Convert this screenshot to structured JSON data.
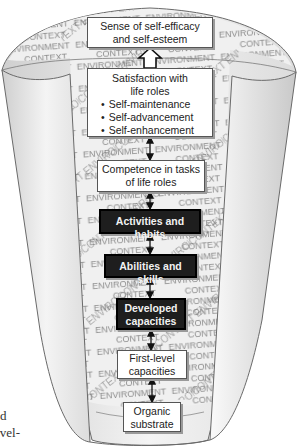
{
  "diagram": {
    "type": "funnel-hierarchy",
    "background_words": [
      "ENVIRONMENT",
      "CONTEXT"
    ],
    "levels": [
      {
        "id": "self-efficacy",
        "lines": [
          "Sense of self-efficacy",
          "and self-esteem"
        ],
        "style": "light"
      },
      {
        "id": "satisfaction",
        "lines": [
          "Satisfaction with",
          "life roles"
        ],
        "bullets": [
          "Self-maintenance",
          "Self-advancement",
          "Self-enhancement"
        ],
        "style": "light"
      },
      {
        "id": "competence",
        "lines": [
          "Competence in tasks",
          "of life roles"
        ],
        "style": "light"
      },
      {
        "id": "activities",
        "lines": [
          "Activities and habits"
        ],
        "style": "dark"
      },
      {
        "id": "abilities",
        "lines": [
          "Abilities and skills"
        ],
        "style": "dark"
      },
      {
        "id": "developed",
        "lines": [
          "Developed",
          "capacities"
        ],
        "style": "dark"
      },
      {
        "id": "first-level",
        "lines": [
          "First-level",
          "capacities"
        ],
        "style": "light"
      },
      {
        "id": "organic",
        "lines": [
          "Organic",
          "substrate"
        ],
        "style": "light"
      }
    ],
    "connectors": [
      {
        "from": "satisfaction",
        "to": "self-efficacy",
        "kind": "hollow-up-arrow"
      },
      {
        "from": "competence",
        "to": "satisfaction",
        "kind": "double-arrow"
      },
      {
        "from": "activities",
        "to": "competence",
        "kind": "double-arrow"
      },
      {
        "from": "abilities",
        "to": "activities",
        "kind": "double-arrow"
      },
      {
        "from": "developed",
        "to": "abilities",
        "kind": "double-arrow"
      },
      {
        "from": "first-level",
        "to": "developed",
        "kind": "double-arrow"
      },
      {
        "from": "organic",
        "to": "first-level",
        "kind": "double-arrow"
      }
    ],
    "colors": {
      "funnel_fill": "#e8e8e8",
      "funnel_edge": "#6a6a6a",
      "dark_box": "#1e1e1e",
      "light_box": "#ffffff",
      "pattern_text": "#7a7a7a"
    }
  },
  "page_fragment": {
    "lines": [
      "d",
      "evel-",
      "…"
    ]
  }
}
